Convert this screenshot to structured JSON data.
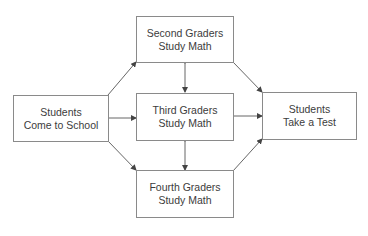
{
  "diagram": {
    "type": "flowchart",
    "nodes": [
      {
        "id": "start",
        "line1": "Students",
        "line2": "Come to School"
      },
      {
        "id": "second",
        "line1": "Second Graders",
        "line2": "Study Math"
      },
      {
        "id": "third",
        "line1": "Third Graders",
        "line2": "Study Math"
      },
      {
        "id": "fourth",
        "line1": "Fourth Graders",
        "line2": "Study Math"
      },
      {
        "id": "end",
        "line1": "Students",
        "line2": "Take a Test"
      }
    ],
    "edges": [
      {
        "from": "start",
        "to": "second",
        "direction": "forward"
      },
      {
        "from": "start",
        "to": "third",
        "direction": "forward"
      },
      {
        "from": "start",
        "to": "fourth",
        "direction": "forward"
      },
      {
        "from": "second",
        "to": "end",
        "direction": "forward"
      },
      {
        "from": "third",
        "to": "end",
        "direction": "forward"
      },
      {
        "from": "fourth",
        "to": "end",
        "direction": "forward"
      },
      {
        "from": "second",
        "to": "third",
        "direction": "bidirectional"
      },
      {
        "from": "third",
        "to": "fourth",
        "direction": "bidirectional"
      }
    ],
    "colors": {
      "line": "#555555",
      "border": "#8a8a8a",
      "text": "#3c3c3c"
    }
  }
}
